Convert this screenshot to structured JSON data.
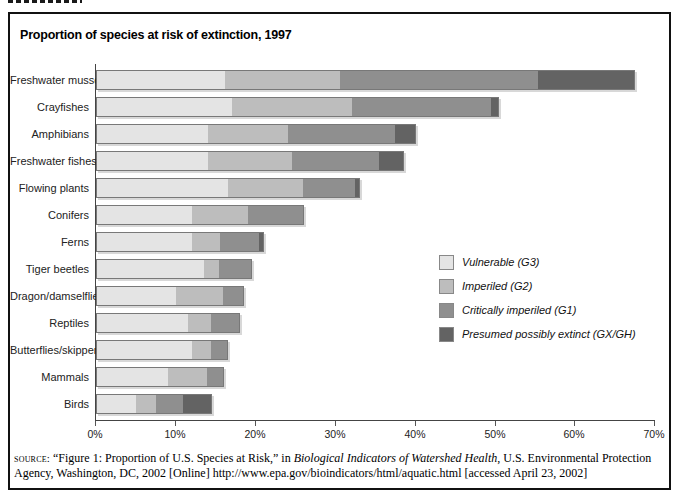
{
  "figure": {
    "title": "Proportion of species at risk of extinction, 1997"
  },
  "source_note": {
    "prefix": "source:",
    "text_before_italic": " “Figure 1: Proportion of U.S. Species at Risk,” in ",
    "italic_title": "Biological Indicators of Watershed Health",
    "text_after_italic": ", U.S. Environmental Protection Agency, Washington, DC, 2002 [Online] http://www.epa.gov/bioindicators/html/aquatic.html [accessed April 23, 2002]"
  },
  "chart_data": {
    "type": "bar",
    "subtype": "horizontal-stacked",
    "title": "Proportion of species at risk of extinction, 1997",
    "xlabel": "",
    "ylabel": "",
    "xlim": [
      0,
      70
    ],
    "x_ticks": [
      "0%",
      "10%",
      "20%",
      "30%",
      "40%",
      "50%",
      "60%",
      "70%"
    ],
    "grid": false,
    "legend_position": "center-right",
    "categories": [
      "Freshwater mussels",
      "Crayfishes",
      "Amphibians",
      "Freshwater fishes",
      "Flowing plants",
      "Conifers",
      "Ferns",
      "Tiger beetles",
      "Dragon/damselflies",
      "Reptiles",
      "Butterflies/skippers",
      "Mammals",
      "Birds"
    ],
    "series": [
      {
        "name": "Vulnerable (G3)",
        "color": "#e4e4e4",
        "values": [
          16,
          17,
          14,
          14,
          16.5,
          12,
          12,
          13.5,
          10,
          11.5,
          12,
          9,
          5
        ]
      },
      {
        "name": "Imperiled (G2)",
        "color": "#bdbdbd",
        "values": [
          14.5,
          15,
          10,
          10.5,
          9.5,
          7,
          3.5,
          2,
          6,
          3,
          2.5,
          5,
          2.5
        ]
      },
      {
        "name": "Critically imperiled (G1)",
        "color": "#8f8f8f",
        "values": [
          25,
          17.5,
          13.5,
          11,
          6.5,
          7,
          5,
          4,
          2.5,
          3.5,
          2,
          2,
          3.5
        ]
      },
      {
        "name": "Presumed possibly extinct (GX/GH)",
        "color": "#636363",
        "values": [
          12,
          1,
          2.5,
          3,
          0.5,
          0,
          0.5,
          0,
          0,
          0,
          0,
          0,
          3.5
        ]
      }
    ],
    "totals": [
      67.5,
      50.5,
      40,
      38.5,
      33,
      26,
      21,
      19.5,
      18.5,
      18,
      16.5,
      16,
      14.5
    ]
  }
}
